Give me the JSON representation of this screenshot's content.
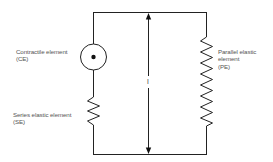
{
  "diagram": {
    "elements": {
      "contractile": {
        "name": "Contractile element",
        "abbr": "(CE)",
        "symbol": "circle-with-dot"
      },
      "series_elastic": {
        "name": "Series elastic element",
        "abbr": "(SE)",
        "symbol": "spring-zigzag"
      },
      "parallel_elastic": {
        "name": "Parallel elastic",
        "name_line2": "element",
        "abbr": "(PE)",
        "symbol": "spring-zigzag"
      }
    },
    "length": {
      "label": "l",
      "symbol": "double-headed-arrow"
    },
    "colors": {
      "line": "#222222",
      "text": "#555555",
      "background": "#ffffff"
    }
  }
}
